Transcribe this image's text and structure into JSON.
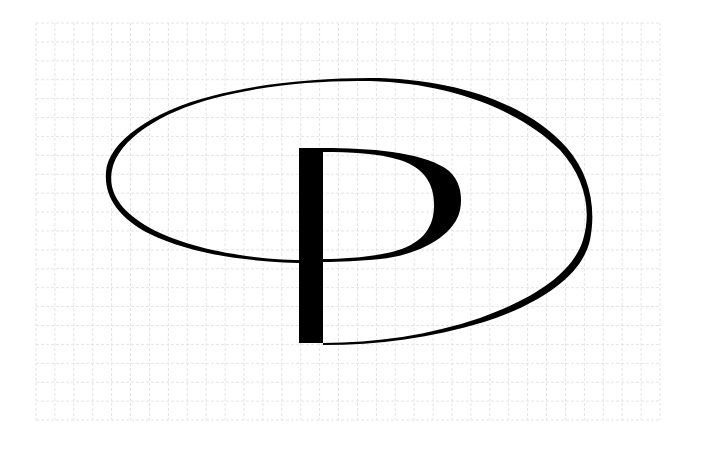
{
  "figure": {
    "background_color": "#ffffff",
    "ink_color": "#000000",
    "grid_color": "#e4e4e4"
  },
  "grid": {
    "x0": 36,
    "y0": 23,
    "x1": 660,
    "y1": 420,
    "cols": 33,
    "rows": 21
  },
  "monogram": {
    "letter": "P",
    "stem": {
      "x": 299,
      "y": 148,
      "width": 24,
      "height": 195
    },
    "bowl": {
      "right_x": 461,
      "top_y": 148,
      "bottom_y": 262
    },
    "oval": {
      "left_x": 111,
      "right_x": 587,
      "top_y": 82,
      "bottom_y": 343
    }
  }
}
